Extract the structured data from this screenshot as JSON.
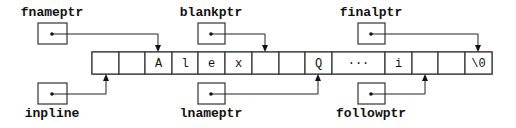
{
  "diagram": {
    "array": {
      "cells": [
        {
          "value": "",
          "x": 92,
          "w": 27
        },
        {
          "value": "",
          "x": 119,
          "w": 26
        },
        {
          "value": "A",
          "x": 145,
          "w": 27
        },
        {
          "value": "l",
          "x": 172,
          "w": 26
        },
        {
          "value": "e",
          "x": 198,
          "w": 27
        },
        {
          "value": "x",
          "x": 225,
          "w": 27
        },
        {
          "value": "",
          "x": 252,
          "w": 27
        },
        {
          "value": "",
          "x": 279,
          "w": 26
        },
        {
          "value": "Q",
          "x": 305,
          "w": 27
        },
        {
          "value": "···",
          "x": 332,
          "w": 53
        },
        {
          "value": "i",
          "x": 385,
          "w": 27
        },
        {
          "value": "",
          "x": 412,
          "w": 26
        },
        {
          "value": "",
          "x": 438,
          "w": 27
        },
        {
          "value": "\\0",
          "x": 465,
          "w": 27
        }
      ]
    },
    "pointers": [
      {
        "name": "fnameptr",
        "position": "top",
        "target_cell_index": 2
      },
      {
        "name": "blankptr",
        "position": "top",
        "target_cell_index": 6
      },
      {
        "name": "finalptr",
        "position": "top",
        "target_cell_index": 13
      },
      {
        "name": "inpline",
        "position": "bottom",
        "target_cell_index": 0
      },
      {
        "name": "lnameptr",
        "position": "bottom",
        "target_cell_index": 8
      },
      {
        "name": "followptr",
        "position": "bottom",
        "target_cell_index": 11
      }
    ]
  }
}
